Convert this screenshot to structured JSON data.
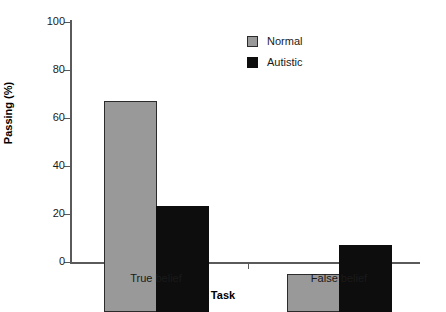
{
  "chart_data": {
    "type": "bar",
    "title": "",
    "xlabel": "Task",
    "ylabel": "Passing (%)",
    "categories": [
      "True belief",
      "False belief"
    ],
    "series": [
      {
        "name": "Normal",
        "values": [
          88,
          16
        ],
        "color": "#999999"
      },
      {
        "name": "Autistic",
        "values": [
          44,
          28
        ],
        "color": "#0d0d0d"
      }
    ],
    "ylim": [
      0,
      100
    ],
    "yticks": [
      0,
      20,
      40,
      60,
      80,
      100
    ],
    "ytick_labels": [
      "0",
      "20",
      "40",
      "60",
      "80",
      "100"
    ],
    "grid": false,
    "legend_position": "top-right",
    "legend_entries": [
      "Normal",
      "Autistic"
    ]
  },
  "axes": {
    "y_labels": {
      "t100": "100",
      "t80": "80",
      "t60": "60",
      "t40": "40",
      "t20": "20",
      "t0": "0"
    },
    "x_labels": {
      "c0": "True belief",
      "c1": "False belief"
    },
    "x_title": "Task",
    "y_title": "Passing (%)"
  },
  "legend": {
    "normal_label": "Normal",
    "autistic_label": "Autistic"
  }
}
